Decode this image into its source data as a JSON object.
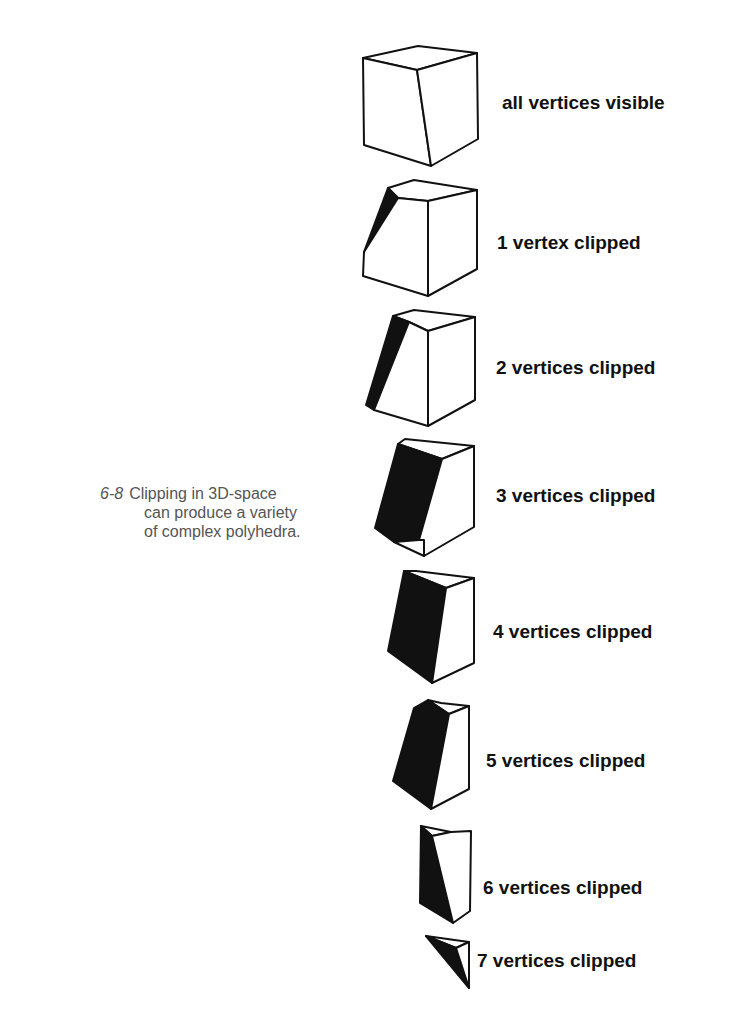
{
  "figure": {
    "number": "6-8",
    "caption_lines": [
      "Clipping in 3D-space",
      "can produce a variety",
      "of complex polyhedra."
    ]
  },
  "labels": [
    "all vertices visible",
    "1 vertex clipped",
    "2 vertices clipped",
    "3 vertices clipped",
    "4 vertices clipped",
    "5 vertices clipped",
    "6 vertices clipped",
    "7 vertices clipped"
  ],
  "colors": {
    "ink": "#111111",
    "caption": "#555555",
    "background": "#ffffff"
  }
}
